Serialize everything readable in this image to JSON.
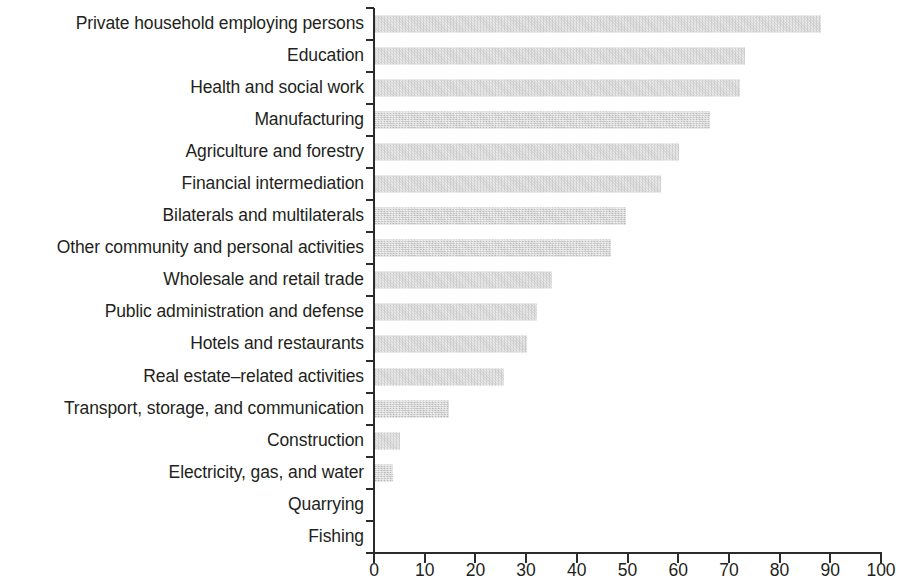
{
  "chart_data": {
    "type": "bar",
    "orientation": "horizontal",
    "title": "",
    "subtitle": "",
    "xlabel": "",
    "ylabel": "",
    "xlim": [
      0,
      100
    ],
    "xticks": [
      0,
      10,
      20,
      30,
      40,
      50,
      60,
      70,
      80,
      90,
      100
    ],
    "xtick_labels": [
      "0",
      "10",
      "20",
      "30",
      "40",
      "50",
      "60",
      "70",
      "80",
      "90",
      "100"
    ],
    "grid": false,
    "legend": null,
    "bar_color": "#c9c9c9",
    "axis_color": "#2b2b2b",
    "text_color": "#231f20",
    "categories": [
      "Private household employing persons",
      "Education",
      "Health and social work",
      "Manufacturing",
      "Agriculture and forestry",
      "Financial intermediation",
      "Bilaterals and multilaterals",
      "Other community and personal activities",
      "Wholesale and retail trade",
      "Public administration and defense",
      "Hotels and restaurants",
      "Real estate–related activities",
      "Transport, storage, and communication",
      "Construction",
      "Electricity, gas, and water",
      "Quarrying",
      "Fishing"
    ],
    "values": [
      88,
      73,
      72,
      66,
      60,
      56.5,
      49.5,
      46.5,
      35,
      32,
      30,
      25.5,
      14.5,
      5,
      3.5,
      0,
      0
    ]
  }
}
